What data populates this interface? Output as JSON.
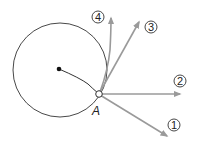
{
  "diagram": {
    "point_label": "A",
    "arrows": [
      {
        "id": "1",
        "label": "1"
      },
      {
        "id": "2",
        "label": "2"
      },
      {
        "id": "3",
        "label": "3"
      },
      {
        "id": "4",
        "label": "4"
      }
    ],
    "colors": {
      "circle": "#333333",
      "arrow": "#9a9a9a",
      "label_ring": "#333333"
    }
  }
}
